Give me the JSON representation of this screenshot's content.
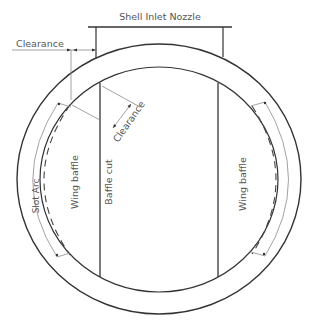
{
  "diagram": {
    "type": "shell-and-tube heat exchanger cross-section with wing baffles",
    "labels": {
      "nozzle": "Shell Inlet Nozzle",
      "clearance_top": "Clearance",
      "clearance_diag": "Clearance",
      "slot_arc": "Slot Arc",
      "wing_baffle_left": "Wing baffle",
      "baffle_cut": "Baffle cut",
      "wing_baffle_right": "Wing baffle"
    },
    "colors": {
      "line": "#333333",
      "thin_line": "#8a8a8a",
      "text": "#555555",
      "background": "#ffffff"
    }
  }
}
